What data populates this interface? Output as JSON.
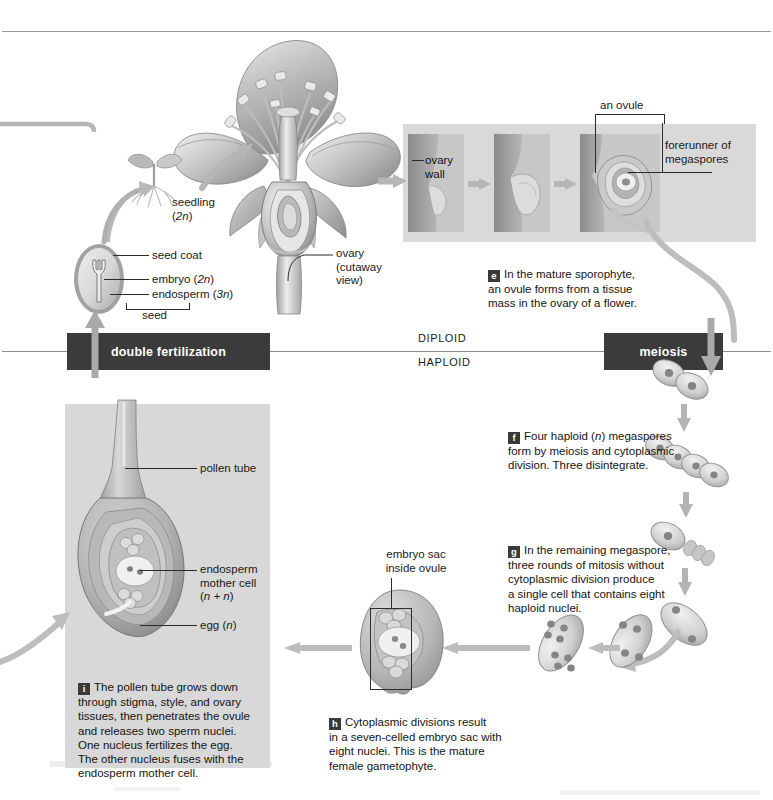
{
  "figure": {
    "ploidy_divider": {
      "upper": "DIPLOID",
      "lower": "HAPLOID"
    },
    "banners": {
      "left": "double fertilization",
      "right": "meiosis"
    }
  },
  "labels": {
    "seedling": "seedling\n(2n)",
    "seed_coat": "seed coat",
    "embryo": "embryo (2n)",
    "endosperm": "endosperm (3n)",
    "seed": "seed",
    "ovary": "ovary\n(cutaway\nview)",
    "ovary_wall": "ovary\nwall",
    "an_ovule": "an ovule",
    "forerunner": "forerunner of\nmegaspores",
    "pollen_tube": "pollen tube",
    "endosperm_mother_cell": "endosperm\nmother cell\n(n + n)",
    "egg": "egg (n)",
    "embryo_sac": "embryo sac\ninside ovule"
  },
  "steps": [
    {
      "id": "e",
      "letter": "e",
      "text": "In the mature sporophyte,\nan ovule forms from a tissue\nmass in the ovary of a flower."
    },
    {
      "id": "f",
      "letter": "f",
      "text": "Four haploid (n) megaspores\nform by meiosis and cytoplasmic\ndivision. Three disintegrate."
    },
    {
      "id": "g",
      "letter": "g",
      "text": "In the remaining megaspore,\nthree rounds of mitosis without\ncytoplasmic division produce\na single cell that contains eight\nhaploid nuclei."
    },
    {
      "id": "h",
      "letter": "h",
      "text": "Cytoplasmic divisions result\nin a seven-celled embryo sac with\neight nuclei. This is the mature\nfemale gametophyte."
    },
    {
      "id": "i",
      "letter": "i",
      "text": "The pollen tube grows down\nthrough stigma, style, and ovary\ntissues, then penetrates the ovule\nand releases two sperm nuclei.\nOne nucleus fertilizes the egg.\nThe other nucleus fuses with the\nendosperm mother cell."
    }
  ],
  "megaspore_sequence": [
    {
      "name": "two-celled-stage",
      "nuclei": 2,
      "cells": 2
    },
    {
      "name": "four-megaspores",
      "nuclei": 4,
      "cells": 4
    },
    {
      "name": "three-disintegrating",
      "nuclei": 1,
      "cells": 1
    },
    {
      "name": "two-nuclei-cell",
      "nuclei": 2,
      "cells": 1
    },
    {
      "name": "four-nuclei-cell",
      "nuclei": 4,
      "cells": 1
    },
    {
      "name": "eight-nuclei-cell",
      "nuclei": 8,
      "cells": 1
    }
  ],
  "colors": {
    "banner_bg": "#3b3b3b",
    "banner_text": "#ffffff",
    "plate_bg": "#d9d9d9",
    "panel_bg": "#d8d8d8",
    "tissue_mid": "#a9a9a9",
    "tissue_dark": "#8a8a8a",
    "tissue_light": "#e2e2e2",
    "arrow_gray": "#b4b4b4",
    "leader_line": "#2b2b2b",
    "page_bg": "#ffffff"
  },
  "icons": {
    "flow_arrow": "flow-arrow-icon",
    "step_chip": "step-letter-chip-icon",
    "bracket": "bracket-icon"
  }
}
